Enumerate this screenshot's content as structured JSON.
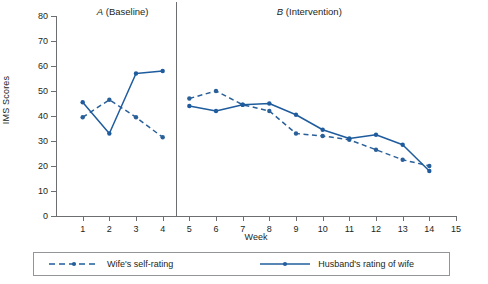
{
  "chart_data": {
    "type": "line",
    "title": "",
    "xlabel": "Week",
    "ylabel": "IMS Scores",
    "xlim": [
      0,
      15
    ],
    "ylim": [
      0,
      80
    ],
    "ytick_step": 10,
    "grid": false,
    "legend_position": "bottom",
    "x": [
      1,
      2,
      3,
      4,
      5,
      6,
      7,
      8,
      9,
      10,
      11,
      12,
      13,
      14
    ],
    "xticks": [
      "1",
      "2",
      "3",
      "4",
      "5",
      "6",
      "7",
      "8",
      "9",
      "10",
      "11",
      "12",
      "13",
      "14",
      "15"
    ],
    "yticks": [
      "0",
      "10",
      "20",
      "30",
      "40",
      "50",
      "60",
      "70",
      "80"
    ],
    "phase_divider_x": 4.5,
    "phases": [
      {
        "id": "A",
        "letter": "A",
        "name": "(Baseline)",
        "start": 1,
        "end": 4,
        "label_center_x": 2.5
      },
      {
        "id": "B",
        "letter": "B",
        "name": "(Intervention)",
        "start": 5,
        "end": 14,
        "label_center_x": 9.5
      }
    ],
    "series": [
      {
        "name": "Wife's self-rating",
        "style": "dashed",
        "color": "#2a6099",
        "values": [
          39.5,
          46.5,
          39.5,
          31.5,
          47,
          50,
          44.5,
          42,
          33,
          32,
          30.5,
          26.5,
          22.5,
          20
        ]
      },
      {
        "name": "Husband's rating of wife",
        "style": "solid",
        "color": "#1f5c9e",
        "values": [
          45.5,
          33,
          57,
          58,
          44,
          42,
          44.5,
          45,
          40.5,
          34.5,
          31,
          32.5,
          28.5,
          18
        ]
      }
    ]
  },
  "legend": {
    "wife_label": "Wife's self-rating",
    "husband_label": "Husband's rating of wife"
  },
  "colors": {
    "series": "#225f9c",
    "axis": "#6d6e71",
    "text": "#231f20"
  }
}
